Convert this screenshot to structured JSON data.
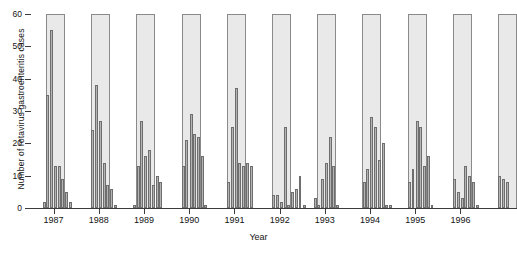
{
  "chart_data": {
    "type": "bar",
    "title": "",
    "xlabel": "Year",
    "ylabel": "Number of rotavirus gastroenteritis cases",
    "ylim": [
      0,
      60
    ],
    "yticks": [
      0,
      10,
      20,
      30,
      40,
      50,
      60
    ],
    "ytick_labels": [
      "0",
      "10",
      "20",
      "30",
      "40",
      "50",
      "60"
    ],
    "xticks": [
      1987,
      1988,
      1989,
      1990,
      1991,
      1992,
      1993,
      1994,
      1995,
      1996
    ],
    "xtick_labels": [
      "1987",
      "1988",
      "1989",
      "1990",
      "1991",
      "1992",
      "1993",
      "1994",
      "1995",
      "1996"
    ],
    "xlim": [
      1986.5,
      1997.25
    ],
    "grid": false,
    "legend": null,
    "bar_color": "#b4b4b4",
    "bar_edge_color": "#6e6e6e",
    "band_color": "#e9e9e9",
    "band_edge_color": "#8a8a8a",
    "axis_color": "#3b3b3b",
    "background": "#ffffff",
    "bar_width_years": 0.066,
    "series_name": "Monthly rotavirus gastroenteritis cases",
    "x_unit": "month",
    "shaded_bands_label": "Winter season (Nov-Apr)",
    "shaded_bands": [
      {
        "start": 1986.83,
        "end": 1987.25
      },
      {
        "start": 1987.83,
        "end": 1988.25
      },
      {
        "start": 1988.83,
        "end": 1989.25
      },
      {
        "start": 1989.83,
        "end": 1990.25
      },
      {
        "start": 1990.83,
        "end": 1991.25
      },
      {
        "start": 1991.83,
        "end": 1992.25
      },
      {
        "start": 1992.83,
        "end": 1993.25
      },
      {
        "start": 1993.83,
        "end": 1994.25
      },
      {
        "start": 1994.83,
        "end": 1995.25
      },
      {
        "start": 1995.83,
        "end": 1996.25
      },
      {
        "start": 1996.83,
        "end": 1997.25
      }
    ],
    "points": [
      {
        "x": 1986.79,
        "y": 2
      },
      {
        "x": 1986.87,
        "y": 35
      },
      {
        "x": 1986.95,
        "y": 55
      },
      {
        "x": 1987.04,
        "y": 13
      },
      {
        "x": 1987.12,
        "y": 13
      },
      {
        "x": 1987.2,
        "y": 9
      },
      {
        "x": 1987.29,
        "y": 5
      },
      {
        "x": 1987.37,
        "y": 2
      },
      {
        "x": 1987.45,
        "y": 0
      },
      {
        "x": 1987.54,
        "y": 0
      },
      {
        "x": 1987.62,
        "y": 0
      },
      {
        "x": 1987.7,
        "y": 0
      },
      {
        "x": 1987.79,
        "y": 0
      },
      {
        "x": 1987.87,
        "y": 24
      },
      {
        "x": 1987.95,
        "y": 38
      },
      {
        "x": 1988.04,
        "y": 27
      },
      {
        "x": 1988.12,
        "y": 14
      },
      {
        "x": 1988.2,
        "y": 7
      },
      {
        "x": 1988.29,
        "y": 6
      },
      {
        "x": 1988.37,
        "y": 1
      },
      {
        "x": 1988.45,
        "y": 0
      },
      {
        "x": 1988.54,
        "y": 0
      },
      {
        "x": 1988.62,
        "y": 0
      },
      {
        "x": 1988.7,
        "y": 0
      },
      {
        "x": 1988.79,
        "y": 1
      },
      {
        "x": 1988.87,
        "y": 13
      },
      {
        "x": 1988.95,
        "y": 27
      },
      {
        "x": 1989.04,
        "y": 16
      },
      {
        "x": 1989.12,
        "y": 18
      },
      {
        "x": 1989.2,
        "y": 7
      },
      {
        "x": 1989.29,
        "y": 10
      },
      {
        "x": 1989.37,
        "y": 8
      },
      {
        "x": 1989.45,
        "y": 0
      },
      {
        "x": 1989.54,
        "y": 0
      },
      {
        "x": 1989.62,
        "y": 0
      },
      {
        "x": 1989.7,
        "y": 0
      },
      {
        "x": 1989.79,
        "y": 0
      },
      {
        "x": 1989.87,
        "y": 13
      },
      {
        "x": 1989.95,
        "y": 21
      },
      {
        "x": 1990.04,
        "y": 29
      },
      {
        "x": 1990.12,
        "y": 23
      },
      {
        "x": 1990.2,
        "y": 22
      },
      {
        "x": 1990.29,
        "y": 16
      },
      {
        "x": 1990.37,
        "y": 1
      },
      {
        "x": 1990.45,
        "y": 0
      },
      {
        "x": 1990.54,
        "y": 0
      },
      {
        "x": 1990.62,
        "y": 0
      },
      {
        "x": 1990.7,
        "y": 0
      },
      {
        "x": 1990.79,
        "y": 0
      },
      {
        "x": 1990.87,
        "y": 8
      },
      {
        "x": 1990.95,
        "y": 25
      },
      {
        "x": 1991.04,
        "y": 37
      },
      {
        "x": 1991.12,
        "y": 14
      },
      {
        "x": 1991.2,
        "y": 13
      },
      {
        "x": 1991.29,
        "y": 14
      },
      {
        "x": 1991.37,
        "y": 13
      },
      {
        "x": 1991.45,
        "y": 0
      },
      {
        "x": 1991.54,
        "y": 0
      },
      {
        "x": 1991.62,
        "y": 0
      },
      {
        "x": 1991.7,
        "y": 0
      },
      {
        "x": 1991.79,
        "y": 0
      },
      {
        "x": 1991.87,
        "y": 4
      },
      {
        "x": 1991.95,
        "y": 4
      },
      {
        "x": 1992.04,
        "y": 2
      },
      {
        "x": 1992.12,
        "y": 25
      },
      {
        "x": 1992.2,
        "y": 1
      },
      {
        "x": 1992.29,
        "y": 5
      },
      {
        "x": 1992.37,
        "y": 6
      },
      {
        "x": 1992.45,
        "y": 10
      },
      {
        "x": 1992.54,
        "y": 1
      },
      {
        "x": 1992.62,
        "y": 0
      },
      {
        "x": 1992.7,
        "y": 0
      },
      {
        "x": 1992.79,
        "y": 3
      },
      {
        "x": 1992.87,
        "y": 1
      },
      {
        "x": 1992.95,
        "y": 9
      },
      {
        "x": 1993.04,
        "y": 14
      },
      {
        "x": 1993.12,
        "y": 22
      },
      {
        "x": 1993.2,
        "y": 13
      },
      {
        "x": 1993.29,
        "y": 1
      },
      {
        "x": 1993.37,
        "y": 0
      },
      {
        "x": 1993.45,
        "y": 0
      },
      {
        "x": 1993.54,
        "y": 0
      },
      {
        "x": 1993.62,
        "y": 0
      },
      {
        "x": 1993.7,
        "y": 0
      },
      {
        "x": 1993.79,
        "y": 0
      },
      {
        "x": 1993.87,
        "y": 8
      },
      {
        "x": 1993.95,
        "y": 12
      },
      {
        "x": 1994.04,
        "y": 28
      },
      {
        "x": 1994.12,
        "y": 25
      },
      {
        "x": 1994.2,
        "y": 15
      },
      {
        "x": 1994.29,
        "y": 20
      },
      {
        "x": 1994.37,
        "y": 1
      },
      {
        "x": 1994.45,
        "y": 1
      },
      {
        "x": 1994.54,
        "y": 0
      },
      {
        "x": 1994.62,
        "y": 0
      },
      {
        "x": 1994.7,
        "y": 0
      },
      {
        "x": 1994.79,
        "y": 0
      },
      {
        "x": 1994.87,
        "y": 8
      },
      {
        "x": 1994.95,
        "y": 12
      },
      {
        "x": 1995.04,
        "y": 27
      },
      {
        "x": 1995.12,
        "y": 25
      },
      {
        "x": 1995.2,
        "y": 13
      },
      {
        "x": 1995.29,
        "y": 16
      },
      {
        "x": 1995.37,
        "y": 1
      },
      {
        "x": 1995.45,
        "y": 0
      },
      {
        "x": 1995.54,
        "y": 0
      },
      {
        "x": 1995.62,
        "y": 0
      },
      {
        "x": 1995.7,
        "y": 0
      },
      {
        "x": 1995.79,
        "y": 0
      },
      {
        "x": 1995.87,
        "y": 9
      },
      {
        "x": 1995.95,
        "y": 5
      },
      {
        "x": 1996.04,
        "y": 3
      },
      {
        "x": 1996.12,
        "y": 13
      },
      {
        "x": 1996.2,
        "y": 10
      },
      {
        "x": 1996.29,
        "y": 8
      },
      {
        "x": 1996.37,
        "y": 1
      },
      {
        "x": 1996.45,
        "y": 0
      },
      {
        "x": 1996.54,
        "y": 0
      },
      {
        "x": 1996.62,
        "y": 0
      },
      {
        "x": 1996.7,
        "y": 0
      },
      {
        "x": 1996.79,
        "y": 0
      },
      {
        "x": 1996.87,
        "y": 10
      },
      {
        "x": 1996.95,
        "y": 9
      },
      {
        "x": 1997.04,
        "y": 8
      },
      {
        "x": 1997.12,
        "y": 0
      }
    ]
  }
}
